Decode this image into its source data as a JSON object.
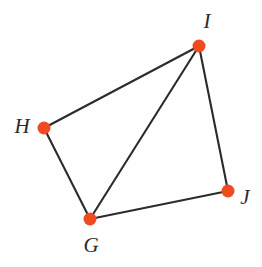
{
  "figure": {
    "kind": "geometry-diagram",
    "background_color": "#fefefe",
    "canvas": {
      "width": 262,
      "height": 267
    },
    "style": {
      "vertex_color": "#f04a20",
      "vertex_radius": 6.5,
      "edge_color": "#2b2b2b",
      "edge_width": 2.1,
      "label_color": "#2a2a2a",
      "label_font_size": 21
    },
    "vertices": [
      {
        "id": "G",
        "label": "G",
        "x": 90,
        "y": 219,
        "label_x": 91,
        "label_y": 245
      },
      {
        "id": "H",
        "label": "H",
        "x": 44,
        "y": 128,
        "label_x": 22,
        "label_y": 126
      },
      {
        "id": "I",
        "label": "I",
        "x": 199,
        "y": 46,
        "label_x": 207,
        "label_y": 21
      },
      {
        "id": "J",
        "label": "J",
        "x": 228,
        "y": 191,
        "label_x": 245,
        "label_y": 197
      }
    ],
    "edges": [
      {
        "id": "GH",
        "from": "G",
        "to": "H",
        "kind": "side"
      },
      {
        "id": "HI",
        "from": "H",
        "to": "I",
        "kind": "side"
      },
      {
        "id": "IJ",
        "from": "I",
        "to": "J",
        "kind": "side"
      },
      {
        "id": "JG",
        "from": "J",
        "to": "G",
        "kind": "side"
      },
      {
        "id": "IG",
        "from": "I",
        "to": "G",
        "kind": "diagonal"
      }
    ]
  }
}
